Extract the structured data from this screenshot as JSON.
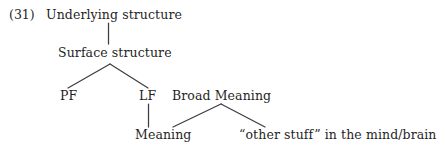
{
  "figure": {
    "example_number": "(31)",
    "type": "linguistic-tree-diagram",
    "line_color": "#3d3d46",
    "text_color": "#1f1f1f",
    "background_color": "#ffffff"
  },
  "nodes": {
    "underlying_structure": "Underlying structure",
    "surface_structure": "Surface structure",
    "pf": "PF",
    "lf": "LF",
    "broad_meaning": "Broad Meaning",
    "meaning": "Meaning",
    "other_stuff": "“other stuff” in the mind/brain"
  },
  "edges": [
    {
      "from": "underlying_structure",
      "to": "surface_structure",
      "style": "vertical"
    },
    {
      "from": "surface_structure",
      "to": "pf",
      "style": "diagonal-left"
    },
    {
      "from": "surface_structure",
      "to": "lf",
      "style": "diagonal-right"
    },
    {
      "from": "lf",
      "to": "meaning",
      "style": "vertical"
    },
    {
      "from": "broad_meaning",
      "to": "meaning",
      "style": "diagonal-left"
    },
    {
      "from": "broad_meaning",
      "to": "other_stuff",
      "style": "diagonal-right"
    }
  ]
}
